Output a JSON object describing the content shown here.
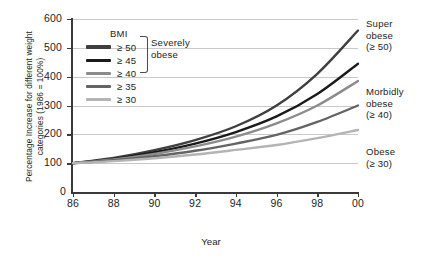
{
  "chart_data": {
    "type": "line",
    "title": "",
    "xlabel": "Year",
    "ylabel": "Percentage Increase for different weight categories (1986 = 100%)",
    "x": [
      86,
      88,
      90,
      92,
      94,
      96,
      98,
      100
    ],
    "xtick_labels": [
      "86",
      "88",
      "90",
      "92",
      "94",
      "96",
      "98",
      "00"
    ],
    "ytick_labels": [
      "100",
      "200",
      "300",
      "400",
      "500",
      "600"
    ],
    "yzero_label": "0",
    "xlim": [
      86,
      100
    ],
    "ylim": [
      0,
      600
    ],
    "grid": true,
    "legend_position": "inside-top-left",
    "series": [
      {
        "name": "≥ 50",
        "color": "#3f3f3f",
        "values": [
          100,
          118,
          145,
          180,
          228,
          300,
          410,
          560
        ]
      },
      {
        "name": "≥ 45",
        "color": "#1a1a1a",
        "values": [
          100,
          115,
          138,
          168,
          208,
          262,
          340,
          445
        ]
      },
      {
        "name": "≥ 40",
        "color": "#8c8c8c",
        "values": [
          100,
          113,
          132,
          158,
          192,
          238,
          300,
          385
        ]
      },
      {
        "name": "≥ 35",
        "color": "#646464",
        "values": [
          100,
          110,
          124,
          143,
          168,
          198,
          243,
          300
        ]
      },
      {
        "name": "≥ 30",
        "color": "#b4b4b4",
        "values": [
          100,
          107,
          117,
          130,
          146,
          163,
          187,
          215
        ]
      }
    ]
  },
  "legend": {
    "title": "BMI",
    "items": [
      {
        "label": "≥ 50",
        "color": "#3f3f3f"
      },
      {
        "label": "≥ 45",
        "color": "#1a1a1a"
      },
      {
        "label": "≥ 40",
        "color": "#8c8c8c"
      },
      {
        "label": "≥ 35",
        "color": "#646464"
      },
      {
        "label": "≥ 30",
        "color": "#b4b4b4"
      }
    ],
    "bracket_label": "Severely\nobese",
    "bracket_label_line1": "Severely",
    "bracket_label_line2": "obese"
  },
  "annotations": [
    {
      "line1": "Super",
      "line2": "obese",
      "line3": "(≥ 50)"
    },
    {
      "line1": "Morbidly",
      "line2": "obese",
      "line3": "(≥ 40)"
    },
    {
      "line1": "Obese",
      "line2": "",
      "line3": "(≥ 30)"
    }
  ]
}
